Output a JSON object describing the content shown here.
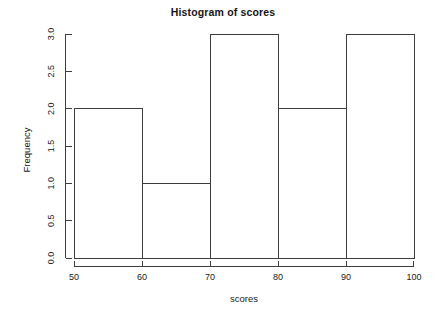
{
  "chart_data": {
    "type": "bar",
    "title": "Histogram of scores",
    "xlabel": "scores",
    "ylabel": "Frequency",
    "categories": [
      "50-60",
      "60-70",
      "70-80",
      "80-90",
      "90-100"
    ],
    "bin_edges": [
      50,
      60,
      70,
      80,
      90,
      100
    ],
    "values": [
      2,
      1,
      3,
      2,
      3
    ],
    "xlim": [
      50,
      100
    ],
    "ylim": [
      0,
      3
    ],
    "xticks": [
      50,
      60,
      70,
      80,
      90,
      100
    ],
    "xtick_labels": [
      "50",
      "60",
      "70",
      "80",
      "90",
      "100"
    ],
    "yticks": [
      0.0,
      0.5,
      1.0,
      1.5,
      2.0,
      2.5,
      3.0
    ],
    "ytick_labels": [
      "0.0",
      "0.5",
      "1.0",
      "1.5",
      "2.0",
      "2.5",
      "3.0"
    ],
    "grid": false,
    "legend": null,
    "bar_fill": "none",
    "line_color": "#3d3d3d",
    "background": "#ffffff"
  },
  "figure": {
    "title": "Histogram of scores",
    "x_axis_label": "scores",
    "y_axis_label": "Frequency"
  }
}
